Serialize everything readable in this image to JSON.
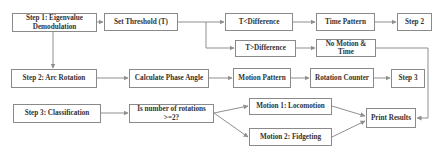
{
  "diagram": {
    "nodes": {
      "step1": "Step 1: Eigenvalue Demodulation",
      "set_threshold": "Set Threshold (T)",
      "t_less_diff": "T<Difference",
      "time_pattern": "Time  Pattern",
      "step2_end": "Step 2",
      "t_greater_diff": "T>Difference",
      "no_motion_time": "No Motion & Time",
      "step2": "Step 2: Arc Rotation",
      "calc_phase": "Calculate Phase Angle",
      "motion_pattern": "Motion Pattern",
      "rotation_counter": "Rotation Counter",
      "step3_end": "Step 3",
      "step3": "Step 3: Classification",
      "decision": "Is number of rotations >=2?",
      "motion1": "Motion 1: Locomotion",
      "motion2": "Motion 2: Fidgeting",
      "print_results": "Print Results"
    },
    "edges": [
      [
        "step1",
        "set_threshold"
      ],
      [
        "set_threshold",
        "t_less_diff"
      ],
      [
        "set_threshold",
        "t_greater_diff"
      ],
      [
        "t_less_diff",
        "time_pattern"
      ],
      [
        "time_pattern",
        "step2_end"
      ],
      [
        "t_greater_diff",
        "no_motion_time"
      ],
      [
        "no_motion_time",
        "print_results"
      ],
      [
        "step1",
        "step2"
      ],
      [
        "step2",
        "calc_phase"
      ],
      [
        "calc_phase",
        "motion_pattern"
      ],
      [
        "motion_pattern",
        "rotation_counter"
      ],
      [
        "rotation_counter",
        "step3_end"
      ],
      [
        "step3",
        "decision"
      ],
      [
        "decision",
        "motion1"
      ],
      [
        "decision",
        "motion2"
      ],
      [
        "motion1",
        "print_results"
      ],
      [
        "motion2",
        "print_results"
      ]
    ],
    "colors": {
      "border": "#8a8a8a",
      "text": "#333333",
      "connector": "#8f8f8f",
      "background": "#ffffff"
    }
  }
}
